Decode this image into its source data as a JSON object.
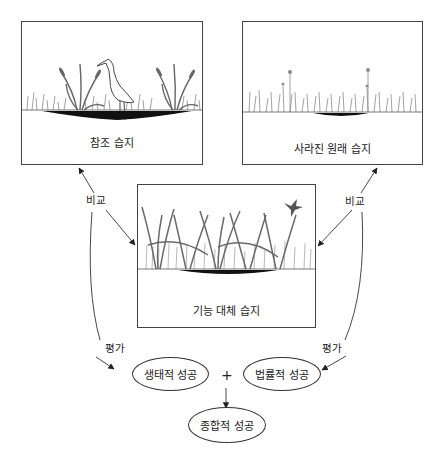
{
  "diagram": {
    "panels": {
      "reference": {
        "label": "참조 습지"
      },
      "lost": {
        "label": "사라진 원래 습지"
      },
      "replacement": {
        "label": "기능 대체 습지"
      }
    },
    "edge_labels": {
      "compare_left": "비교",
      "compare_right": "비교",
      "evaluate_left": "평가",
      "evaluate_right": "평가",
      "plus": "+"
    },
    "outcomes": {
      "ecological": "생태적 성공",
      "legal": "법률적 성공",
      "overall": "종합적 성공"
    },
    "colors": {
      "line": "#333333",
      "vegetation": "#7a7a7a",
      "water": "#111111"
    }
  }
}
